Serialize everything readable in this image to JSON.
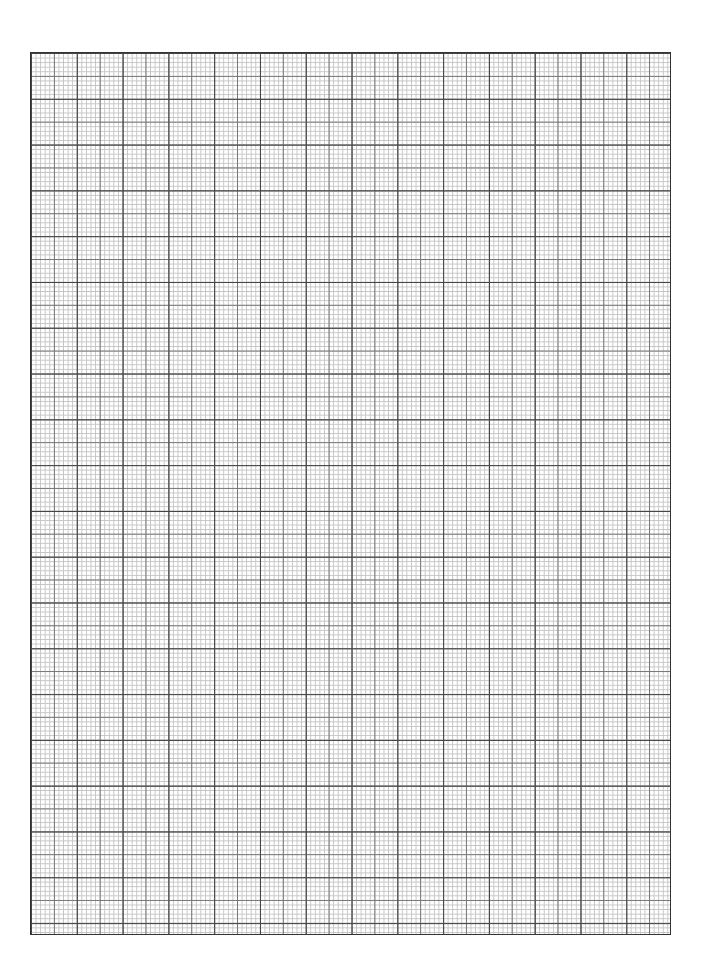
{
  "document": {
    "type": "graph-paper",
    "grid": {
      "major_spacing_px": 45.8,
      "medium_spacing_px": 22.9,
      "minor_spacing_px": 4.58,
      "line_colors": {
        "major": "#444444",
        "medium": "#777777",
        "minor": "#c4c4c4"
      },
      "background": "#ffffff"
    },
    "title": ""
  }
}
